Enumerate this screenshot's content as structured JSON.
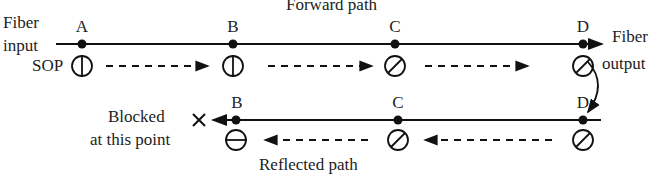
{
  "title": "Forward path",
  "bottom_title": "Reflected path",
  "labels": {
    "fiber_input": [
      "Fiber",
      "input"
    ],
    "sop": "SOP",
    "fiber_output": [
      "Fiber",
      "output"
    ],
    "blocked": [
      "Blocked",
      "at this point"
    ]
  },
  "forward_points": [
    {
      "name": "A",
      "x": 82,
      "sop": "vertical"
    },
    {
      "name": "B",
      "x": 233,
      "sop": "vertical"
    },
    {
      "name": "C",
      "x": 395,
      "sop": "diagonal-45"
    },
    {
      "name": "D",
      "x": 583,
      "sop": "diagonal-45"
    }
  ],
  "reflected_points": [
    {
      "name": "B",
      "x": 233,
      "sop": "horizontal"
    },
    {
      "name": "C",
      "x": 395,
      "sop": "diagonal-45"
    },
    {
      "name": "D",
      "x": 583,
      "sop": "diagonal-45"
    }
  ],
  "blocked_marker": "×"
}
